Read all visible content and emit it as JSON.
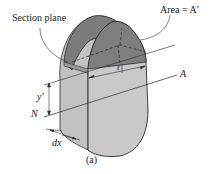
{
  "diagram": {
    "labels": {
      "section_plane": "Section plane",
      "area": "Area = A′",
      "t": "t",
      "axis_a": "A",
      "axis_n": "N",
      "y_prime": "y′",
      "dx": "dx",
      "caption": "(a)"
    },
    "colors": {
      "body_light": "#c9c9c9",
      "body_mid": "#b5b5b5",
      "top_dark": "#7a7a7a",
      "section_face": "#8f8f8f",
      "stroke": "#2b2b2b"
    }
  }
}
